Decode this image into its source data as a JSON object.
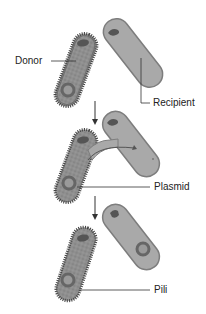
{
  "labels": {
    "donor": "Donor",
    "recipient": "Recipient",
    "plasmid": "Plasmid",
    "pili": "Pili"
  },
  "stages": [
    {
      "name": "before-contact"
    },
    {
      "name": "conjugation-bridge-transfer"
    },
    {
      "name": "after-transfer"
    }
  ],
  "colors": {
    "cell_fill": "#a9a9a9",
    "cell_outline": "#7d7d7d",
    "donor_fill": "#8f8f8f",
    "dna": "#555555",
    "pili": "#333333",
    "arrow": "#333333"
  }
}
